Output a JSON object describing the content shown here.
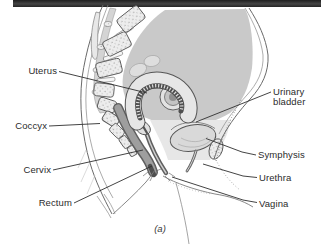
{
  "figure": {
    "type": "anatomical-diagram",
    "caption": "(a)",
    "labels": {
      "uterus": "Uterus",
      "coccyx": "Coccyx",
      "cervix": "Cervix",
      "rectum": "Rectum",
      "urinary_bladder": "Urinary bladder",
      "symphysis": "Symphysis",
      "urethra": "Urethra",
      "vagina": "Vagina"
    }
  },
  "colors": {
    "top_bar": "#2e2e2e",
    "cavity_gray": "#c9c9c9",
    "pelvic_wash": "#e7e7e7",
    "bone_fill": "#ededed",
    "bone_dot": "#949494",
    "outline": "#5a5a5a",
    "rectum_fill": "#9e9e9e",
    "leader_line": "#2f2f2f"
  }
}
